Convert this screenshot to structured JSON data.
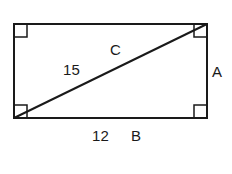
{
  "figure": {
    "type": "geometry-diagram",
    "shape": "rectangle-with-diagonal",
    "background_color": "#ffffff",
    "stroke_color": "#1a1a1a",
    "rectangle": {
      "left": 14,
      "top": 24,
      "right": 207,
      "bottom": 118,
      "width": 193,
      "height": 94,
      "stroke_width": 2
    },
    "diagonal": {
      "from": "bottom-left",
      "to": "top-right",
      "x1": 14,
      "y1": 118,
      "x2": 207,
      "y2": 24,
      "stroke_width": 2
    },
    "right_angle_markers": {
      "size": 13,
      "stroke_width": 1.5,
      "corners": [
        "top-left",
        "top-right",
        "bottom-left",
        "bottom-right"
      ]
    },
    "labels": {
      "hypotenuse_letter": "C",
      "hypotenuse_value": "15",
      "vertical_side_letter": "A",
      "horizontal_side_value": "12",
      "horizontal_side_letter": "B"
    }
  }
}
